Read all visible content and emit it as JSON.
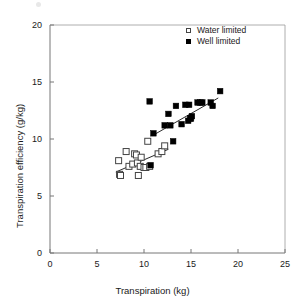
{
  "chart_data": {
    "type": "scatter",
    "title": "",
    "xlabel": "Transpiration (kg)",
    "ylabel": "Transpiration efficiency (g/kg)",
    "xlim": [
      0,
      25
    ],
    "ylim": [
      0,
      20
    ],
    "xticks": [
      0,
      5,
      10,
      15,
      20,
      25
    ],
    "yticks": [
      0,
      5,
      10,
      15,
      20
    ],
    "grid": false,
    "legend_position": "top-right",
    "series": [
      {
        "name": "Water limited",
        "marker": "open-square",
        "color": "#ffffff",
        "edge_color": "#444444",
        "points": [
          [
            7.3,
            8.1
          ],
          [
            7.4,
            6.9
          ],
          [
            7.5,
            6.8
          ],
          [
            8.1,
            8.9
          ],
          [
            8.4,
            7.6
          ],
          [
            8.8,
            7.8
          ],
          [
            9.0,
            8.7
          ],
          [
            9.2,
            8.6
          ],
          [
            9.3,
            7.9
          ],
          [
            9.4,
            6.8
          ],
          [
            9.6,
            7.6
          ],
          [
            9.7,
            8.4
          ],
          [
            10.0,
            7.5
          ],
          [
            10.2,
            7.5
          ],
          [
            10.4,
            9.8
          ],
          [
            10.6,
            7.6
          ],
          [
            11.5,
            8.7
          ],
          [
            11.9,
            8.9
          ],
          [
            12.2,
            9.4
          ]
        ],
        "trend_line": {
          "x1": 7.0,
          "y1": 7.1,
          "x2": 12.6,
          "y2": 9.1
        }
      },
      {
        "name": "Well limited",
        "marker": "filled-square",
        "color": "#000000",
        "points": [
          [
            10.7,
            7.7
          ],
          [
            10.6,
            13.3
          ],
          [
            11.0,
            10.5
          ],
          [
            12.6,
            12.2
          ],
          [
            12.2,
            11.2
          ],
          [
            12.8,
            11.2
          ],
          [
            13.1,
            9.8
          ],
          [
            13.4,
            12.9
          ],
          [
            14.0,
            11.3
          ],
          [
            14.4,
            13.0
          ],
          [
            14.8,
            13.0
          ],
          [
            14.7,
            11.6
          ],
          [
            14.9,
            11.8
          ],
          [
            15.0,
            11.8
          ],
          [
            15.1,
            12.0
          ],
          [
            15.7,
            13.2
          ],
          [
            16.0,
            13.2
          ],
          [
            16.2,
            13.2
          ],
          [
            17.1,
            13.2
          ],
          [
            17.3,
            12.9
          ],
          [
            18.1,
            14.2
          ]
        ],
        "trend_line": {
          "x1": 10.9,
          "y1": 10.3,
          "x2": 17.9,
          "y2": 13.6
        }
      }
    ]
  },
  "axes": {
    "x_title": "Transpiration (kg)",
    "y_title": "Transpiration efficiency (g/kg)",
    "x_tick_labels": [
      "0",
      "5",
      "10",
      "15",
      "20",
      "25"
    ],
    "y_tick_labels": [
      "0",
      "5",
      "10",
      "15",
      "20"
    ]
  },
  "legend": {
    "items": [
      {
        "label": "Water limited",
        "marker": "open-square"
      },
      {
        "label": "Well limited",
        "marker": "filled-square"
      }
    ]
  }
}
